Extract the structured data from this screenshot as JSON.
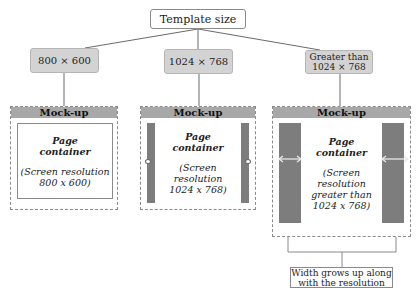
{
  "root": {
    "label": "Template size"
  },
  "branches": [
    {
      "label": "800 × 600"
    },
    {
      "label": "1024 × 768"
    },
    {
      "label": "Greater than 1024 × 768",
      "line1": "Greater than",
      "line2": "1024 × 768"
    }
  ],
  "mockups": [
    {
      "header": "Mock-up",
      "title1": "Page",
      "title2": "container",
      "res1": "(Screen resolution",
      "res2": "800 x 600)"
    },
    {
      "header": "Mock-up",
      "title1": "Page",
      "title2": "container",
      "res1": "(Screen resolution",
      "res2": "1024 x 768)"
    },
    {
      "header": "Mock-up",
      "title1": "Page",
      "title2": "container",
      "res1": "(Screen resolution",
      "res2": "greater than",
      "res3": "1024 x 768)"
    }
  ],
  "note": {
    "line1": "Width grows up along",
    "line2": "with the resolution"
  },
  "colors": {
    "header_gray": "#a8a8a8",
    "box_gray": "#d3d3d3",
    "gutter_gray": "#7d7d7d"
  }
}
